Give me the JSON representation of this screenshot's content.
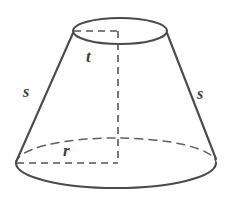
{
  "figure": {
    "name": "truncated-cone-frustum",
    "background_color": "#ffffff",
    "stroke_color": "#4a4a4a",
    "dash_color": "#555555",
    "label_color": "#3d3d3d"
  },
  "labels": {
    "top_radius": "t",
    "bottom_radius": "r",
    "slant_left": "s",
    "slant_right": "s"
  },
  "geometry": {
    "top_ellipse": {
      "cx": 120,
      "cy": 31,
      "rx": 47,
      "ry": 13
    },
    "bottom_ellipse": {
      "cx": 116,
      "cy": 163,
      "rx": 100,
      "ry": 25
    },
    "left_slant": {
      "x1": 73,
      "y1": 33,
      "x2": 16,
      "y2": 162
    },
    "right_slant": {
      "x1": 167,
      "y1": 33,
      "x2": 216,
      "y2": 158
    },
    "height_line": {
      "x": 118,
      "y1": 31,
      "y2": 163
    },
    "top_radius_line": {
      "x1": 74,
      "x2": 118,
      "y": 31
    },
    "bottom_radius_line": {
      "x1": 17,
      "x2": 118,
      "y": 163
    }
  }
}
